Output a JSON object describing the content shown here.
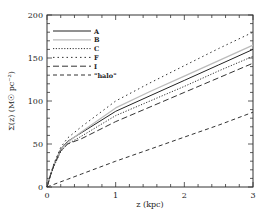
{
  "chart_data": {
    "type": "line",
    "title": "",
    "xlabel": "z (kpc)",
    "ylabel": "Σ(z)  (M☉ pc⁻²)",
    "xlim": [
      0,
      3
    ],
    "ylim": [
      0,
      200
    ],
    "x_ticks": [
      0,
      1,
      2,
      3
    ],
    "y_ticks": [
      0,
      50,
      100,
      150,
      200
    ],
    "grid": false,
    "legend_position": "upper left",
    "x": [
      0,
      0.05,
      0.1,
      0.2,
      0.3,
      0.5,
      1.0,
      1.5,
      2.0,
      2.5,
      3.0
    ],
    "series": [
      {
        "name": "A",
        "style": "solid",
        "color": "#222222",
        "values": [
          0,
          14,
          26,
          44,
          53,
          63,
          88,
          106,
          124,
          142,
          160
        ]
      },
      {
        "name": "B",
        "style": "solid",
        "color": "#bbbbbb",
        "values": [
          0,
          14,
          26,
          43,
          52,
          64,
          92,
          111,
          129,
          147,
          165
        ]
      },
      {
        "name": "C",
        "style": "dotted",
        "color": "#333333",
        "values": [
          0,
          13,
          24,
          41,
          50,
          59,
          83,
          100,
          117,
          135,
          152
        ]
      },
      {
        "name": "F",
        "style": "spaced-dot",
        "color": "#333333",
        "values": [
          0,
          14,
          27,
          46,
          57,
          70,
          100,
          121,
          141,
          161,
          180
        ]
      },
      {
        "name": "I",
        "style": "long-dash",
        "color": "#333333",
        "values": [
          0,
          13,
          25,
          42,
          50,
          56,
          76,
          93,
          110,
          127,
          144
        ]
      },
      {
        "name": "\"halo\"",
        "style": "dashed",
        "color": "#333333",
        "values": [
          0,
          1.5,
          3,
          6,
          9,
          15,
          30,
          44,
          58,
          72,
          87
        ]
      }
    ]
  },
  "axes": {
    "x_tick_labels": [
      "0",
      "1",
      "2",
      "3"
    ],
    "y_tick_labels": [
      "0",
      "50",
      "100",
      "150",
      "200"
    ],
    "xlabel": "z (kpc)",
    "ylabel_prefix": "Σ(z)",
    "ylabel_units": "(M☉ pc⁻²)"
  },
  "legend": [
    "A",
    "B",
    "C",
    "F",
    "I",
    "\"halo\""
  ]
}
